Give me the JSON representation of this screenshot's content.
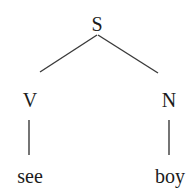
{
  "diagram": {
    "type": "syntax-tree",
    "colors": {
      "background": "#ffffff",
      "line": "#3a3a3a",
      "text": "#1c1c1c"
    },
    "nodes": [
      {
        "id": "S",
        "label": "S",
        "kind": "category",
        "x": 97,
        "y": 24
      },
      {
        "id": "V",
        "label": "V",
        "kind": "category",
        "x": 30,
        "y": 100
      },
      {
        "id": "N",
        "label": "N",
        "kind": "category",
        "x": 169,
        "y": 100
      },
      {
        "id": "see",
        "label": "see",
        "kind": "terminal",
        "x": 30,
        "y": 176
      },
      {
        "id": "boy",
        "label": "boy",
        "kind": "terminal",
        "x": 170,
        "y": 176
      }
    ],
    "edges": [
      {
        "from": "S",
        "to": "V",
        "x1": 97,
        "y1": 35,
        "x2": 40,
        "y2": 72
      },
      {
        "from": "S",
        "to": "N",
        "x1": 98,
        "y1": 35,
        "x2": 158,
        "y2": 73
      },
      {
        "from": "V",
        "to": "see",
        "x1": 29,
        "y1": 120,
        "x2": 29,
        "y2": 155
      },
      {
        "from": "N",
        "to": "boy",
        "x1": 169,
        "y1": 120,
        "x2": 169,
        "y2": 155
      }
    ]
  }
}
